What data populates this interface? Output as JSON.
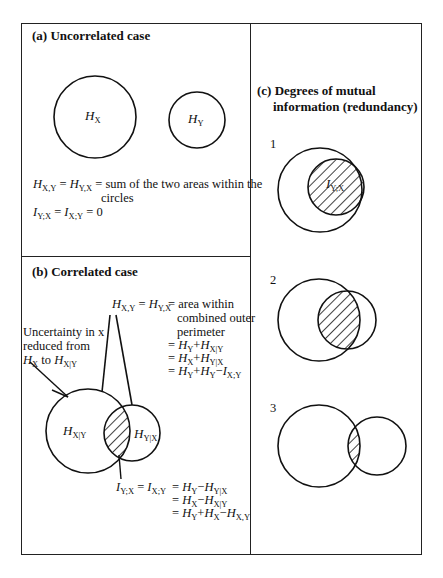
{
  "panel_a": {
    "title": "(a) Uncorrelated case",
    "circle_x_label": "H",
    "circle_x_sub": "X",
    "circle_y_label": "H",
    "circle_y_sub": "Y",
    "eq1_lhs": "H",
    "eq1_lhs_sub": "X,Y",
    "eq1_eq": " = ",
    "eq1_mid": "H",
    "eq1_mid_sub": "Y,X",
    "eq1_rhs": " = sum of the two areas within the",
    "eq1_rhs_cont": "circles",
    "eq2_lhs": "I",
    "eq2_lhs_sub": "Y;X",
    "eq2_eq": " = ",
    "eq2_mid": "I",
    "eq2_mid_sub": "X;Y",
    "eq2_rhs": " = 0"
  },
  "panel_b": {
    "title": "(b) Correlated case",
    "uncertainty_line1": "Uncertainty in x",
    "uncertainty_line2": "reduced from",
    "uncertainty_line3_a": "H",
    "uncertainty_line3_a_sub": "X",
    "uncertainty_line3_to": " to ",
    "uncertainty_line3_b": "H",
    "uncertainty_line3_b_sub": "X|Y",
    "joint_lhs": "H",
    "joint_lhs_sub": "X,Y",
    "joint_eq": " = ",
    "joint_mid": "H",
    "joint_mid_sub": "Y,X",
    "joint_desc1": "= area within",
    "joint_desc2": "combined outer",
    "joint_desc3": "perimeter",
    "joint_lines": [
      {
        "pre": "= ",
        "a": "H",
        "a_sub": "Y",
        "op": "+",
        "b": "H",
        "b_sub": "X|Y"
      },
      {
        "pre": "= ",
        "a": "H",
        "a_sub": "X",
        "op": "+",
        "b": "H",
        "b_sub": "Y|X"
      },
      {
        "pre": "= ",
        "a": "H",
        "a_sub": "Y",
        "op": "+",
        "b": "H",
        "b_sub": "Y",
        "op2": "−",
        "c": "I",
        "c_sub": "X;Y"
      }
    ],
    "circle_left_label": "H",
    "circle_left_sub": "X|Y",
    "circle_right_label": "H",
    "circle_right_sub": "Y|X",
    "mi_lhs": "I",
    "mi_lhs_sub": "Y;X",
    "mi_eq": " = ",
    "mi_mid": "I",
    "mi_mid_sub": "X;Y",
    "mi_lines": [
      {
        "pre": "= ",
        "a": "H",
        "a_sub": "Y",
        "op": "−",
        "b": "H",
        "b_sub": "Y|X"
      },
      {
        "pre": "= ",
        "a": "H",
        "a_sub": "X",
        "op": "−",
        "b": "H",
        "b_sub": "X|Y"
      },
      {
        "pre": "= ",
        "a": "H",
        "a_sub": "Y",
        "op": "+",
        "b": "H",
        "b_sub": "X",
        "op2": "−",
        "c": "H",
        "c_sub": "X,Y"
      }
    ]
  },
  "panel_c": {
    "title_line1": "(c) Degrees of mutual",
    "title_line2": "information (redundancy)",
    "cases": [
      {
        "number": "1",
        "label": "I",
        "label_sub": "Y;X"
      },
      {
        "number": "2"
      },
      {
        "number": "3"
      }
    ]
  },
  "colors": {
    "stroke": "#111111",
    "background": "#ffffff"
  }
}
